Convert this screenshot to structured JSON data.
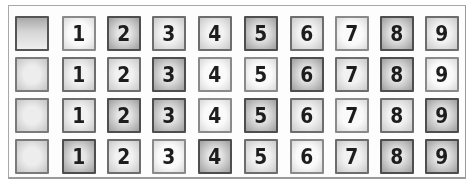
{
  "grid": {
    "columns": 10,
    "rows": [
      {
        "tiles": [
          "",
          "1",
          "2",
          "3",
          "4",
          "5",
          "6",
          "7",
          "8",
          "9"
        ]
      },
      {
        "tiles": [
          "",
          "1",
          "2",
          "3",
          "4",
          "5",
          "6",
          "7",
          "8",
          "9"
        ]
      },
      {
        "tiles": [
          "",
          "1",
          "2",
          "3",
          "4",
          "5",
          "6",
          "7",
          "8",
          "9"
        ]
      },
      {
        "tiles": [
          "",
          "1",
          "2",
          "3",
          "4",
          "5",
          "6",
          "7",
          "8",
          "9"
        ]
      }
    ]
  }
}
